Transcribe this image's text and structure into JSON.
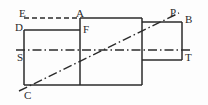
{
  "figure": {
    "width": 208,
    "height": 105,
    "background_color": "#fdfdfd",
    "stroke_color": "#2b2b2b",
    "label_color": "#2a2a2a"
  },
  "labels": [
    {
      "text": "E",
      "x": 19,
      "y": 8,
      "name": "vertex-label-e"
    },
    {
      "text": "A",
      "x": 76,
      "y": 8,
      "name": "vertex-label-a"
    },
    {
      "text": "P",
      "x": 170,
      "y": 7,
      "name": "vertex-label-p"
    },
    {
      "text": "B",
      "x": 185,
      "y": 14,
      "name": "vertex-label-b"
    },
    {
      "text": "D",
      "x": 15,
      "y": 22,
      "name": "vertex-label-d"
    },
    {
      "text": "F",
      "x": 83,
      "y": 24,
      "name": "vertex-label-f"
    },
    {
      "text": "S",
      "x": 17,
      "y": 52,
      "name": "vertex-label-s"
    },
    {
      "text": "T",
      "x": 185,
      "y": 52,
      "name": "vertex-label-t"
    },
    {
      "text": "C",
      "x": 24,
      "y": 90,
      "name": "vertex-label-c"
    }
  ],
  "geometry": {
    "main_rect": {
      "x1": 24,
      "y1": 18,
      "x2": 142,
      "y2": 85
    },
    "right_rect": {
      "x1": 142,
      "y1": 22,
      "x2": 182,
      "y2": 60
    },
    "solid_lines": [
      {
        "name": "main-rect-top",
        "x1": 80,
        "y1": 18,
        "x2": 142,
        "y2": 18
      },
      {
        "name": "main-rect-left",
        "x1": 24,
        "y1": 30,
        "x2": 24,
        "y2": 85
      },
      {
        "name": "main-rect-bottom",
        "x1": 24,
        "y1": 85,
        "x2": 142,
        "y2": 85
      },
      {
        "name": "main-rect-right",
        "x1": 142,
        "y1": 18,
        "x2": 142,
        "y2": 85
      },
      {
        "name": "line-d-f",
        "x1": 24,
        "y1": 30,
        "x2": 80,
        "y2": 30
      },
      {
        "name": "vertical-through-a-f",
        "x1": 80,
        "y1": 18,
        "x2": 80,
        "y2": 85
      },
      {
        "name": "right-rect-top",
        "x1": 142,
        "y1": 22,
        "x2": 182,
        "y2": 22
      },
      {
        "name": "right-rect-right",
        "x1": 182,
        "y1": 22,
        "x2": 182,
        "y2": 60
      },
      {
        "name": "right-rect-bottom",
        "x1": 142,
        "y1": 60,
        "x2": 182,
        "y2": 60
      }
    ],
    "dashed_lines": [
      {
        "name": "line-e-a",
        "x1": 24,
        "y1": 18,
        "x2": 80,
        "y2": 18
      }
    ],
    "dash_dot_lines": [
      {
        "name": "center-axis-horizontal",
        "x1": 16,
        "y1": 50,
        "x2": 192,
        "y2": 50
      },
      {
        "name": "cutting-line-c-p",
        "x1": 19,
        "y1": 91,
        "x2": 179,
        "y2": 13
      }
    ]
  }
}
